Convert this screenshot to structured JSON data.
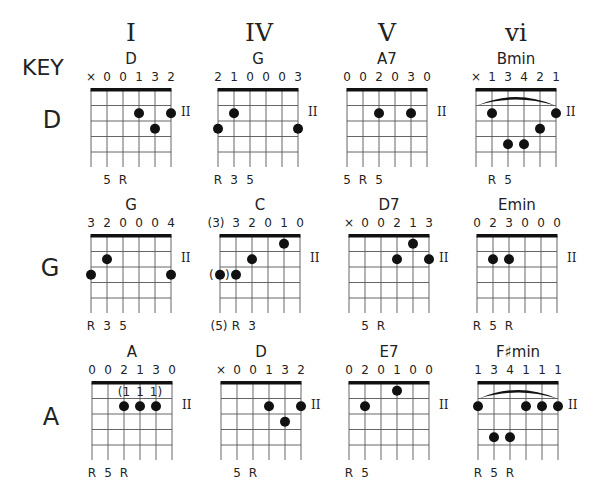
{
  "title_label": "KEY",
  "columns": [
    {
      "numeral": "I"
    },
    {
      "numeral": "IV"
    },
    {
      "numeral": "V"
    },
    {
      "numeral": "vi"
    }
  ],
  "rows": [
    {
      "key": "D"
    },
    {
      "key": "G"
    },
    {
      "key": "A"
    }
  ],
  "fret_marker": "II",
  "colors": {
    "ink": "#111111",
    "grid": "#555555",
    "background": "#ffffff"
  },
  "chords": [
    [
      {
        "name": "D",
        "fingers": [
          "×",
          "0",
          "0",
          "1",
          "3",
          "2"
        ],
        "dots": [
          [
            3,
            1
          ],
          [
            5,
            1
          ],
          [
            4,
            2
          ]
        ],
        "intervals": [
          [
            "",
            0
          ],
          [
            "5",
            1
          ],
          [
            "R",
            2
          ]
        ],
        "barre": false,
        "marker": true
      },
      {
        "name": "G",
        "fingers": [
          "2",
          "1",
          "0",
          "0",
          "0",
          "3"
        ],
        "dots": [
          [
            1,
            1
          ],
          [
            0,
            2
          ],
          [
            5,
            2
          ]
        ],
        "intervals": [
          [
            "R",
            0
          ],
          [
            "3",
            1
          ],
          [
            "5",
            2
          ]
        ],
        "barre": false,
        "marker": true
      },
      {
        "name": "A7",
        "fingers": [
          "0",
          "0",
          "2",
          "0",
          "3",
          "0"
        ],
        "dots": [
          [
            2,
            1
          ],
          [
            4,
            1
          ]
        ],
        "intervals": [
          [
            "5",
            0
          ],
          [
            "R",
            1
          ],
          [
            "5",
            2
          ]
        ],
        "barre": false,
        "marker": true
      },
      {
        "name": "Bmin",
        "fingers": [
          "×",
          "1",
          "3",
          "4",
          "2",
          "1"
        ],
        "dots": [
          [
            1,
            1
          ],
          [
            5,
            1
          ],
          [
            4,
            2
          ],
          [
            2,
            3
          ],
          [
            3,
            3
          ]
        ],
        "intervals": [
          [
            "R",
            1
          ],
          [
            "5",
            2
          ]
        ],
        "barre": true,
        "marker": true
      }
    ],
    [
      {
        "name": "G",
        "fingers": [
          "3",
          "2",
          "0",
          "0",
          "0",
          "4"
        ],
        "dots": [
          [
            1,
            1
          ],
          [
            0,
            2
          ],
          [
            5,
            2
          ]
        ],
        "intervals": [
          [
            "R",
            0
          ],
          [
            "3",
            1
          ],
          [
            "5",
            2
          ]
        ],
        "barre": false,
        "marker": true
      },
      {
        "name": "C",
        "fingers": [
          "(3)",
          "3",
          "2",
          "0",
          "1",
          "0"
        ],
        "dots": [
          [
            4,
            0
          ],
          [
            2,
            1
          ],
          [
            0,
            2
          ],
          [
            1,
            2
          ]
        ],
        "intervals": [
          [
            "(5)",
            0
          ],
          [
            "R",
            1
          ],
          [
            "3",
            2
          ]
        ],
        "barre": false,
        "marker": true,
        "paren_dot": 0
      },
      {
        "name": "D7",
        "fingers": [
          "×",
          "0",
          "0",
          "2",
          "1",
          "3"
        ],
        "dots": [
          [
            4,
            0
          ],
          [
            3,
            1
          ],
          [
            5,
            1
          ]
        ],
        "intervals": [
          [
            "5",
            1
          ],
          [
            "R",
            2
          ]
        ],
        "barre": false,
        "marker": true
      },
      {
        "name": "Emin",
        "fingers": [
          "0",
          "2",
          "3",
          "0",
          "0",
          "0"
        ],
        "dots": [
          [
            1,
            1
          ],
          [
            2,
            1
          ]
        ],
        "intervals": [
          [
            "R",
            0
          ],
          [
            "5",
            1
          ],
          [
            "R",
            2
          ]
        ],
        "barre": false,
        "marker": true
      }
    ],
    [
      {
        "name": "A",
        "fingers": [
          "0",
          "0",
          "2",
          "1",
          "3",
          "0"
        ],
        "dots": [
          [
            2,
            1
          ],
          [
            3,
            1
          ],
          [
            4,
            1
          ]
        ],
        "intervals": [
          [
            "R",
            0
          ],
          [
            "5",
            1
          ],
          [
            "R",
            2
          ]
        ],
        "barre": false,
        "marker": true,
        "alt_fingers": [
          "(1",
          "1",
          "1)"
        ]
      },
      {
        "name": "D",
        "fingers": [
          "×",
          "0",
          "0",
          "1",
          "3",
          "2"
        ],
        "dots": [
          [
            3,
            1
          ],
          [
            5,
            1
          ],
          [
            4,
            2
          ]
        ],
        "intervals": [
          [
            "5",
            1
          ],
          [
            "R",
            2
          ]
        ],
        "barre": false,
        "marker": true
      },
      {
        "name": "E7",
        "fingers": [
          "0",
          "2",
          "0",
          "1",
          "0",
          "0"
        ],
        "dots": [
          [
            3,
            0
          ],
          [
            1,
            1
          ]
        ],
        "intervals": [
          [
            "R",
            0
          ],
          [
            "5",
            1
          ]
        ],
        "barre": false,
        "marker": true
      },
      {
        "name": "F♯min",
        "fingers": [
          "1",
          "3",
          "4",
          "1",
          "1",
          "1"
        ],
        "dots": [
          [
            0,
            1
          ],
          [
            3,
            1
          ],
          [
            4,
            1
          ],
          [
            5,
            1
          ],
          [
            1,
            3
          ],
          [
            2,
            3
          ]
        ],
        "intervals": [
          [
            "R",
            0
          ],
          [
            "5",
            1
          ],
          [
            "R",
            2
          ]
        ],
        "barre": true,
        "marker": true
      }
    ]
  ]
}
